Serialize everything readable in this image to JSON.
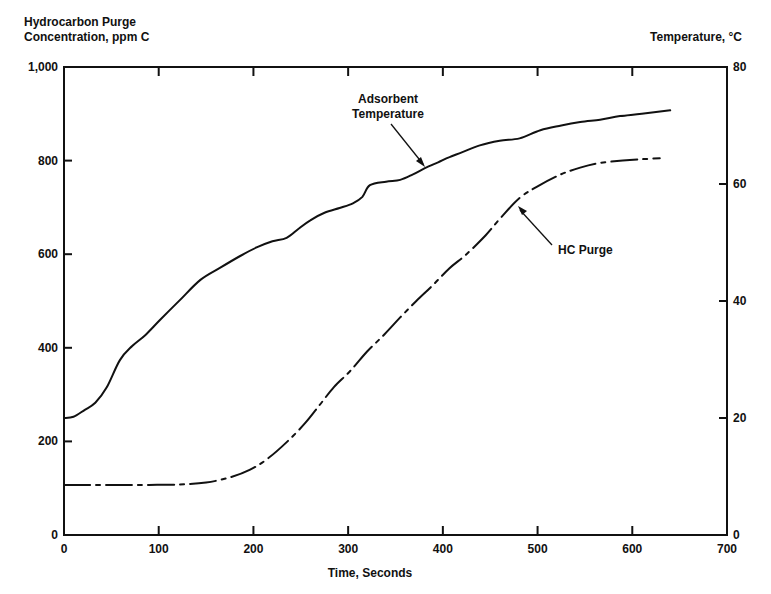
{
  "chart_data": {
    "type": "line",
    "title": "",
    "xlabel": "Time, Seconds",
    "ylabel": "Hydrocarbon Purge Concentration, ppm C",
    "ylabel_lines": [
      "Hydrocarbon Purge",
      "Concentration, ppm C"
    ],
    "y2label": "Temperature, °C",
    "xlim": [
      0,
      700
    ],
    "ylim": [
      0,
      1000
    ],
    "y2lim": [
      0,
      80
    ],
    "grid": false,
    "x_ticks": [
      0,
      100,
      200,
      300,
      400,
      500,
      600,
      700
    ],
    "x_tick_labels": [
      "0",
      "100",
      "200",
      "300",
      "400",
      "500",
      "600",
      "700"
    ],
    "y_ticks": [
      0,
      200,
      400,
      600,
      800,
      1000
    ],
    "y_tick_labels": [
      "0",
      "200",
      "400",
      "600",
      "800",
      "1,000"
    ],
    "y2_ticks": [
      0,
      20,
      40,
      60,
      80
    ],
    "y2_tick_labels": [
      "0",
      "20",
      "40",
      "60",
      "80"
    ],
    "series": [
      {
        "name": "Adsorbent Temperature",
        "axis": "right",
        "style": "solid",
        "label_lines": [
          "Adsorbent",
          "Temperature"
        ],
        "x": [
          0,
          10,
          22,
          33,
          45,
          59,
          72,
          86,
          101,
          122,
          144,
          165,
          186,
          204,
          220,
          235,
          248,
          260,
          275,
          291,
          305,
          315,
          323,
          340,
          355,
          368,
          381,
          395,
          407,
          420,
          439,
          460,
          481,
          503,
          525,
          545,
          566,
          587,
          610,
          640
        ],
        "values": [
          20.0,
          20.2,
          21.4,
          22.6,
          25.2,
          29.9,
          32.3,
          34.2,
          36.7,
          40.1,
          43.6,
          45.7,
          47.7,
          49.2,
          50.2,
          50.8,
          52.4,
          53.8,
          55.1,
          55.9,
          56.7,
          57.8,
          59.8,
          60.4,
          60.7,
          61.6,
          62.7,
          63.7,
          64.6,
          65.4,
          66.6,
          67.4,
          67.8,
          69.2,
          70.0,
          70.6,
          71.0,
          71.6,
          72.0,
          72.6
        ]
      },
      {
        "name": "HC Purge",
        "axis": "left",
        "style": "dash-dot",
        "label_lines": [
          "HC Purge"
        ],
        "x": [
          0,
          30,
          60,
          90,
          122,
          150,
          175,
          196,
          215,
          236,
          255,
          270,
          285,
          302,
          320,
          338,
          355,
          372,
          390,
          407,
          425,
          445,
          462,
          481,
          500,
          524,
          545,
          566,
          590,
          610,
          629
        ],
        "values": [
          107,
          107,
          107,
          107,
          108,
          112,
          123,
          139,
          163,
          200,
          240,
          278,
          316,
          350,
          392,
          428,
          465,
          500,
          535,
          570,
          600,
          640,
          680,
          720,
          745,
          770,
          785,
          795,
          800,
          803,
          805
        ]
      }
    ],
    "annotations": [
      {
        "text_lines": [
          "Adsorbent",
          "Temperature"
        ],
        "points_to_series": "Adsorbent Temperature",
        "at_x": 380
      },
      {
        "text_lines": [
          "HC Purge"
        ],
        "points_to_series": "HC Purge",
        "at_x": 475
      }
    ]
  }
}
